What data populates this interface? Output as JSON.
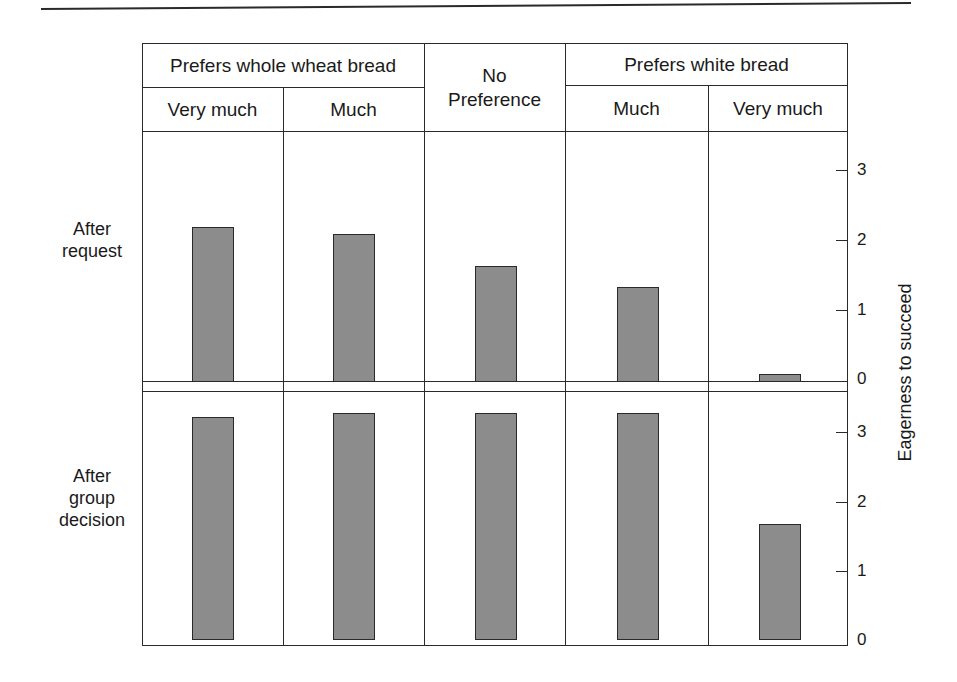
{
  "chart_data": {
    "type": "bar",
    "title": "",
    "xlabel": "",
    "ylabel": "Eagerness to succeed",
    "ylim": [
      0,
      3.5
    ],
    "yticks": [
      0,
      1,
      2,
      3
    ],
    "grid": false,
    "column_groups": [
      {
        "label": "Prefers whole wheat bread",
        "columns": [
          "Very much",
          "Much"
        ]
      },
      {
        "label": "No Preference",
        "columns": [
          "No Preference"
        ]
      },
      {
        "label": "Prefers white bread",
        "columns": [
          "Much",
          "Very much"
        ]
      }
    ],
    "categories": [
      "Whole wheat – Very much",
      "Whole wheat – Much",
      "No Preference",
      "White – Much",
      "White – Very much"
    ],
    "series": [
      {
        "name": "After request",
        "values": [
          2.2,
          2.1,
          1.65,
          1.35,
          0.1
        ]
      },
      {
        "name": "After group decision",
        "values": [
          3.2,
          3.25,
          3.25,
          3.25,
          1.65
        ]
      }
    ]
  },
  "header": {
    "group_whole_wheat": "Prefers whole wheat bread",
    "group_none_line1": "No",
    "group_none_line2": "Preference",
    "group_white": "Prefers white bread",
    "sub": [
      "Very much",
      "Much",
      "Much",
      "Very much"
    ]
  },
  "rows": {
    "after_request_line1": "After",
    "after_request_line2": "request",
    "after_group_line1": "After",
    "after_group_line2": "group",
    "after_group_line3": "decision"
  },
  "axis": {
    "ylabel": "Eagerness to succeed",
    "ticks": [
      "0",
      "1",
      "2",
      "3"
    ]
  }
}
